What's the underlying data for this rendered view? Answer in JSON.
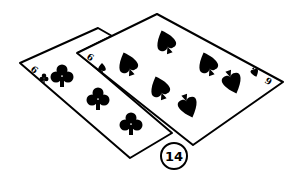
{
  "illustration": {
    "subject": "Two overlapping playing cards",
    "back_card": {
      "rank": "6",
      "suit": "clubs",
      "index_text": "6"
    },
    "front_card": {
      "rank": "6",
      "suit": "spades",
      "index_text": "6",
      "bottom_index_text": "9"
    },
    "callout_number": "14",
    "colors": {
      "ink": "#000000",
      "paper": "#ffffff"
    }
  }
}
